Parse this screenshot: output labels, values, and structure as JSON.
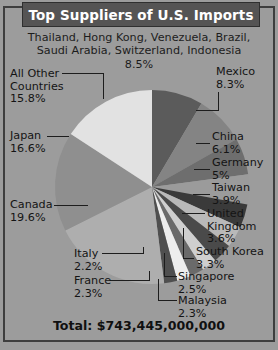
{
  "title": "Top Suppliers of U.S. Imports",
  "top_caption": {
    "line1": "Thailand, Hong Kong, Venezuela, Brazil,",
    "line2": "Saudi Arabia, Switzerland, Indonesia",
    "percent": "8.5%"
  },
  "labels": {
    "all_other": {
      "line1": "All Other",
      "line2": "Countries",
      "percent": "15.8%"
    },
    "japan": {
      "name": "Japan",
      "percent": "16.6%"
    },
    "canada": {
      "name": "Canada",
      "percent": "19.6%"
    },
    "italy": {
      "name": "Italy",
      "percent": "2.2%"
    },
    "france": {
      "name": "France",
      "percent": "2.3%"
    },
    "mexico": {
      "name": "Mexico",
      "percent": "8.3%"
    },
    "china": {
      "name": "China",
      "percent": "6.1%"
    },
    "germany": {
      "name": "Germany",
      "percent": "5%"
    },
    "taiwan": {
      "name": "Taiwan",
      "percent": "3.9%"
    },
    "uk": {
      "line1": "United",
      "line2": "Kingdom",
      "percent": "3.6%"
    },
    "south_korea": {
      "name": "South Korea",
      "percent": "3.3%"
    },
    "singapore": {
      "name": "Singapore",
      "percent": "2.5%"
    },
    "malaysia": {
      "name": "Malaysia",
      "percent": "2.3%"
    }
  },
  "total": "Total: $743,445,000,000",
  "colors": {
    "background": "#9c9c9c",
    "title_bar": "#555454",
    "frame": "#3e3e3e",
    "text": "#141414",
    "title_text": "#ffffff"
  },
  "chart_data": {
    "type": "pie",
    "title": "Top Suppliers of U.S. Imports",
    "total_label": "Total: $743,445,000,000",
    "total_value": 743445000000,
    "unit": "percent of total U.S. imports",
    "legend": "callout labels with leader lines",
    "start_angle_deg": -90,
    "direction": "clockwise",
    "categories": [
      "Thailand, Hong Kong, Venezuela, Brazil, Saudi Arabia, Switzerland, Indonesia",
      "Mexico",
      "China",
      "Germany",
      "Taiwan",
      "United Kingdom",
      "South Korea",
      "Singapore",
      "Malaysia",
      "France",
      "Italy",
      "Canada",
      "Japan",
      "All Other Countries"
    ],
    "values": [
      8.5,
      8.3,
      6.1,
      5,
      3.9,
      3.6,
      3.3,
      2.5,
      2.3,
      2.3,
      2.2,
      19.6,
      16.6,
      15.8
    ],
    "slice_colors": [
      "#5b5b5b",
      "#848484",
      "#6e6e6e",
      "#9b9b9b",
      "#3a3a3a",
      "#b9b9b9",
      "#4a4a4a",
      "#cfcfcf",
      "#6a6a6a",
      "#ededed",
      "#4f4f4f",
      "#aeaeae",
      "#8f8f8f",
      "#e2e2e2"
    ]
  }
}
